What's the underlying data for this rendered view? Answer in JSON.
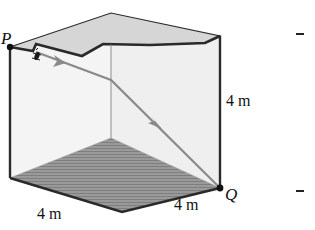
{
  "figure": {
    "points": {
      "start": "P",
      "end": "Q"
    },
    "dimensions": {
      "height": "4 m",
      "front_width": "4 m",
      "side_depth": "4 m"
    },
    "colors": {
      "edge": "#2a2a2a",
      "lid": "#d4d4d4",
      "wall": "#f3f3f3",
      "floor": "#8f8f8f",
      "path": "#8a8a8a"
    },
    "icons": {
      "bug": "bug-icon",
      "path_arrow": "arrow-icon"
    }
  }
}
